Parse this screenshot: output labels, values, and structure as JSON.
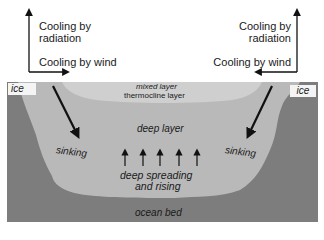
{
  "diagram": {
    "left_annotations": {
      "radiation": "Cooling by\nradiation",
      "radiation_line1": "Cooling by",
      "radiation_line2": "radiation",
      "wind": "Cooling by wind"
    },
    "right_annotations": {
      "radiation_line1": "Cooling by",
      "radiation_line2": "radiation",
      "wind": "Cooling by wind"
    },
    "ocean_labels": {
      "ice_left": "ice",
      "ice_right": "ice",
      "mixed_layer": "mixed layer",
      "thermocline_layer": "thermocline layer",
      "deep_layer": "deep layer",
      "sinking_left": "sinking",
      "sinking_right": "sinking",
      "deep_spreading_line1": "deep spreading",
      "deep_spreading_line2": "and rising",
      "ocean_bed": "ocean bed"
    },
    "rising_arrow_count": 5,
    "colors": {
      "ocean_bed": "#7d7d7d",
      "deep_layer": "#b9b9b9",
      "mixed_layer": "#cfcfcf",
      "ice_box": "#f4f4f4",
      "arrow": "#111111",
      "text": "#1a1a1a"
    }
  }
}
